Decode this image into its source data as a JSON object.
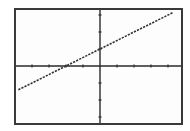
{
  "chart_data": {
    "type": "line",
    "title": "",
    "xlabel": "",
    "ylabel": "",
    "xlim": [
      -5,
      5
    ],
    "ylim": [
      -3.5,
      3.5
    ],
    "xticks": [
      -4,
      -3,
      -2,
      -1,
      1,
      2,
      3,
      4
    ],
    "yticks": [
      -3,
      -2,
      -1,
      1,
      2,
      3
    ],
    "grid": false,
    "legend": null,
    "series": [
      {
        "name": "y = 0.5x + 1",
        "equation": "y = 0.5x + 1",
        "slope": 0.5,
        "intercept": 1,
        "x": [
          -4.8,
          -2,
          0,
          4.3
        ],
        "y": [
          -1.4,
          0,
          1,
          3.15
        ],
        "style": "dashed",
        "color": "#333333"
      }
    ],
    "annotations": []
  },
  "colors": {
    "frame": "#3a3a3a",
    "axes": "#2a2a2a",
    "line": "#333333",
    "background": "#fdfdfd"
  }
}
